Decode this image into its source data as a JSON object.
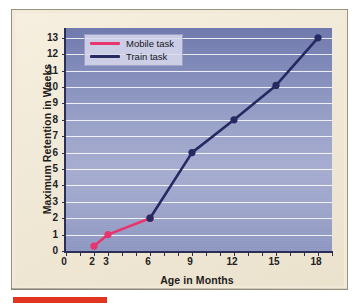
{
  "figure": {
    "background_color": "#f2ead8",
    "plot_background_top": "#6f79ad",
    "plot_background_bottom": "#8f98c3",
    "axis_color": "#2b2f58",
    "gridline_color": "#ffffff",
    "red_bar_color": "#e03520"
  },
  "legend": {
    "position": "top-left-inside",
    "entries": [
      {
        "label": "Mobile task",
        "color": "#e8356d"
      },
      {
        "label": "Train task",
        "color": "#252a63"
      }
    ]
  },
  "chart_data": {
    "type": "line",
    "title": "",
    "xlabel": "Age in Months",
    "ylabel": "Maximum Retention in Weeks",
    "xlim": [
      0,
      19
    ],
    "ylim": [
      0,
      13.6
    ],
    "xticks": [
      0,
      2,
      3,
      6,
      9,
      12,
      15,
      18
    ],
    "xtick_labels": [
      "0",
      "2",
      "3",
      "6",
      "9",
      "12",
      "15",
      "18"
    ],
    "yticks": [
      0,
      1,
      2,
      3,
      4,
      5,
      6,
      7,
      8,
      9,
      10,
      11,
      12,
      13
    ],
    "ytick_labels": [
      "0",
      "1",
      "2",
      "3",
      "4",
      "5",
      "6",
      "7",
      "8",
      "9",
      "10",
      "11",
      "12",
      "13"
    ],
    "grid": "horizontal",
    "legend_position": "upper left",
    "series": [
      {
        "name": "Mobile task",
        "color": "#e8356d",
        "marker": "circle",
        "x": [
          2,
          3,
          6
        ],
        "y": [
          0.3,
          1.0,
          2.0
        ]
      },
      {
        "name": "Train task",
        "color": "#252a63",
        "marker": "circle",
        "x": [
          6,
          9,
          12,
          15,
          18
        ],
        "y": [
          2.0,
          6.0,
          8.0,
          10.1,
          13.0
        ]
      }
    ]
  }
}
